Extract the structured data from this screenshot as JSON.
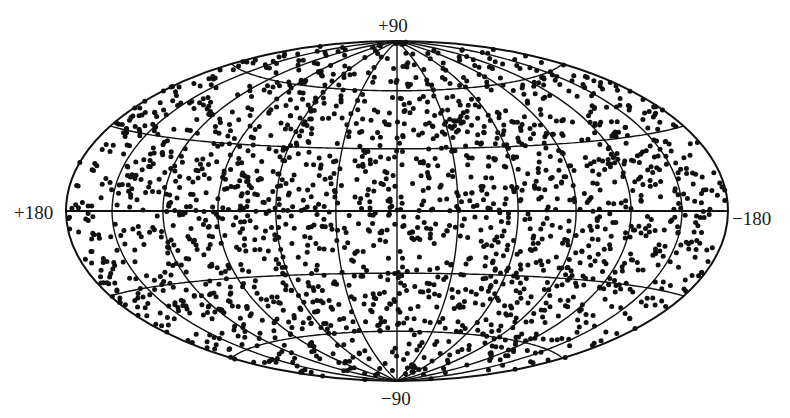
{
  "chart_data": {
    "type": "scatter",
    "projection": "hammer-aitoff all-sky",
    "title": "",
    "xlabel": "",
    "ylabel": "",
    "labels": {
      "top": "+90",
      "bottom": "−90",
      "left": "+180",
      "right": "−180"
    },
    "longitude_range": [
      180,
      -180
    ],
    "latitude_range": [
      -90,
      90
    ],
    "meridian_spacing_deg": 30,
    "parallel_spacing_deg": 30,
    "grid": true,
    "points": {
      "description": "approximately isotropic distribution of sources over the whole sky",
      "approx_count": 2000,
      "marker": "filled circle",
      "marker_diameter_px": 5,
      "color": "#111111"
    },
    "geometry": {
      "center_x": 397,
      "center_y": 211,
      "semi_major_px": 331,
      "semi_minor_px": 170
    }
  },
  "colors": {
    "background": "#ffffff",
    "ink": "#111111"
  }
}
